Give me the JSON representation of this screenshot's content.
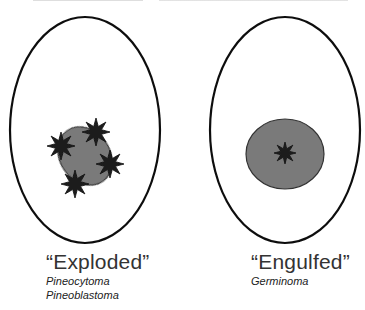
{
  "panels": [
    {
      "id": "exploded",
      "title": "“Exploded”",
      "subtitles": [
        "Pineocytoma",
        "Pineoblastoma"
      ],
      "shape": {
        "cx": 85,
        "cy": 130,
        "rx": 75,
        "ry": 113
      },
      "mass": {
        "cx": 85,
        "cy": 156,
        "rx": 25,
        "ry": 31,
        "rotate": -35,
        "fill": "#7a7a7a"
      },
      "stars": [
        {
          "cx": 61,
          "cy": 146
        },
        {
          "cx": 96,
          "cy": 132
        },
        {
          "cx": 110,
          "cy": 164
        },
        {
          "cx": 75,
          "cy": 184
        }
      ]
    },
    {
      "id": "engulfed",
      "title": "“Engulfed”",
      "subtitles": [
        "Germinoma"
      ],
      "shape": {
        "cx": 285,
        "cy": 130,
        "rx": 75,
        "ry": 113
      },
      "mass": {
        "cx": 285,
        "cy": 154,
        "rx": 39,
        "ry": 35,
        "rotate": 0,
        "fill": "#7a7a7a"
      },
      "stars": [
        {
          "cx": 285,
          "cy": 153
        }
      ]
    }
  ],
  "colors": {
    "outline": "#111111",
    "star": "#1e1e1e",
    "mass": "#7a7a7a"
  }
}
